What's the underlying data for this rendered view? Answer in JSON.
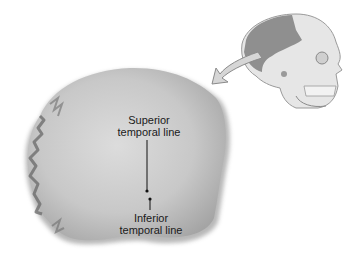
{
  "figure": {
    "labels": [
      {
        "id": "superior",
        "line1": "Superior",
        "line2": "temporal line"
      },
      {
        "id": "inferior",
        "line1": "Inferior",
        "line2": "temporal line"
      }
    ],
    "inset": {
      "depicts": "skull-lateral-view",
      "highlight": "parietal-bone",
      "arrow": "orientation-arrow"
    },
    "colors": {
      "background": "#ffffff",
      "bone_fill": "#c9c9c9",
      "bone_shadow": "#8a8a8a",
      "skull_fill": "#e4e4e4",
      "skull_highlight": "#8f8f8f",
      "arrow_fill": "#d6d6d6",
      "leader_line": "#111111"
    }
  }
}
